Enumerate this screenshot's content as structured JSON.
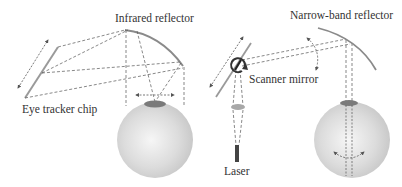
{
  "figure": {
    "left_panel": {
      "labels": {
        "reflector": "Infrared reflector",
        "chip": "Eye tracker chip"
      }
    },
    "right_panel": {
      "labels": {
        "reflector": "Narrow-band reflector",
        "mirror": "Scanner mirror",
        "laser": "Laser"
      }
    },
    "colors": {
      "line": "#555555",
      "reflector": "#8a8a8a",
      "eye": "#d8d8d8",
      "pupil": "#7a7a7a"
    }
  }
}
